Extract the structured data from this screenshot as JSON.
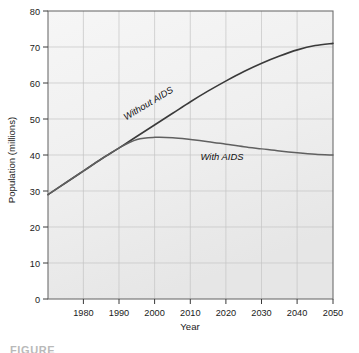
{
  "figure": {
    "caption_partial": "FIGURE"
  },
  "chart_data": {
    "type": "line",
    "title": "",
    "xlabel": "Year",
    "ylabel": "Population (millions)",
    "xlim": [
      1970,
      2050
    ],
    "ylim": [
      0,
      80
    ],
    "xticks": [
      1980,
      1990,
      2000,
      2010,
      2020,
      2030,
      2040,
      2050
    ],
    "xtick_labels": [
      "1980",
      "1990",
      "2000",
      "2010",
      "2020",
      "2030",
      "2040",
      "2050"
    ],
    "yticks": [
      0,
      10,
      20,
      30,
      40,
      50,
      60,
      70,
      80
    ],
    "ytick_labels": [
      "0",
      "10",
      "20",
      "30",
      "40",
      "50",
      "60",
      "70",
      "80"
    ],
    "grid": true,
    "legend": "inline-annotations",
    "plot_background": "#f0f0f0",
    "grid_color": "#c2c2c2",
    "line_color": "#3a3a3a",
    "series": [
      {
        "name": "Without AIDS",
        "label": "Without AIDS",
        "label_rotation_deg": -31,
        "x": [
          1970,
          1975,
          1980,
          1985,
          1990,
          1995,
          2000,
          2005,
          2010,
          2015,
          2020,
          2025,
          2030,
          2035,
          2040,
          2045,
          2050
        ],
        "values": [
          29.0,
          32.3,
          35.6,
          38.9,
          42.0,
          45.2,
          48.4,
          51.6,
          54.8,
          57.8,
          60.6,
          63.2,
          65.5,
          67.5,
          69.2,
          70.4,
          71.0
        ]
      },
      {
        "name": "With AIDS",
        "label": "With AIDS",
        "label_rotation_deg": 0,
        "x": [
          1970,
          1975,
          1980,
          1985,
          1990,
          1995,
          2000,
          2005,
          2010,
          2015,
          2020,
          2025,
          2030,
          2035,
          2040,
          2045,
          2050
        ],
        "values": [
          29.0,
          32.3,
          35.6,
          38.9,
          42.0,
          44.3,
          44.9,
          44.8,
          44.3,
          43.7,
          43.0,
          42.3,
          41.7,
          41.1,
          40.6,
          40.2,
          40.0
        ]
      }
    ]
  }
}
